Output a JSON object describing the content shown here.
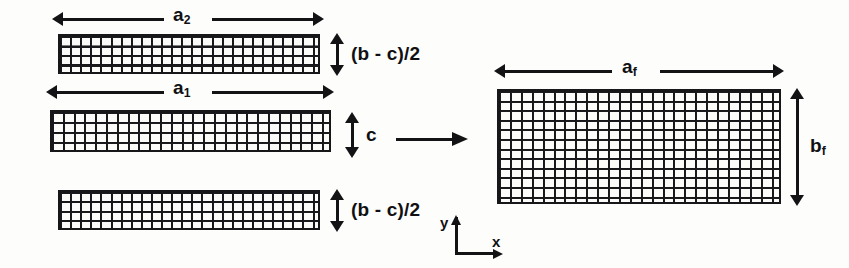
{
  "figure": {
    "type": "mesh-assembly-diagram",
    "ink_color": "#131316",
    "background_color": "#fdfdfc"
  },
  "left_group": {
    "blocks": [
      {
        "id": "strip-top",
        "width_label": "a",
        "width_sub": "2",
        "height_label": "(b - c)/2",
        "cols": 26,
        "rows": 4
      },
      {
        "id": "strip-middle",
        "width_label": "a",
        "width_sub": "1",
        "height_label": "c",
        "cols": 26,
        "rows": 4
      },
      {
        "id": "strip-bottom",
        "width_label": "",
        "width_sub": "",
        "height_label": "(b - c)/2",
        "cols": 26,
        "rows": 4
      }
    ]
  },
  "right_group": {
    "block": {
      "id": "assembled-mesh",
      "width_label": "a",
      "width_sub": "f",
      "height_label": "b",
      "height_sub": "f",
      "cols": 26,
      "rows": 12
    }
  },
  "transform": {
    "arrow_name": "assembly-arrow",
    "direction": "right"
  },
  "axes": {
    "y_label": "y",
    "x_label": "x"
  },
  "labels": {
    "a2": "a",
    "a2_sub": "2",
    "a1": "a",
    "a1_sub": "1",
    "af": "a",
    "af_sub": "f",
    "bf": "b",
    "bf_sub": "f",
    "c": "c",
    "bc2_top": "(b - c)/2",
    "bc2_bottom": "(b - c)/2"
  }
}
